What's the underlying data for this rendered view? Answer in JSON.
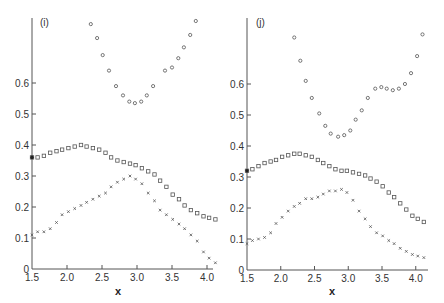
{
  "chart_data": [
    {
      "type": "scatter",
      "panel_label": "(i)",
      "title": "",
      "xlabel": "x",
      "ylabel": "",
      "xlim": [
        1.5,
        4.15
      ],
      "ylim": [
        0,
        0.82
      ],
      "x_ticks": [
        "1.5",
        "2.0",
        "2.5",
        "3.0",
        "3.5",
        "4.0"
      ],
      "y_ticks": [
        "0",
        "0.1",
        "0.2",
        "0.3",
        "0.4",
        "0.5",
        "0.6"
      ],
      "grid": false,
      "legend": null,
      "series": [
        {
          "name": "upper (circles)",
          "marker": "circle",
          "x": [
            2.34,
            2.43,
            2.51,
            2.6,
            2.7,
            2.8,
            2.89,
            2.97,
            3.06,
            3.14,
            3.23,
            3.4,
            3.5,
            3.59,
            3.67,
            3.76,
            3.84
          ],
          "y": [
            0.79,
            0.745,
            0.69,
            0.64,
            0.59,
            0.56,
            0.54,
            0.535,
            0.54,
            0.56,
            0.59,
            0.64,
            0.65,
            0.68,
            0.715,
            0.755,
            0.8
          ]
        },
        {
          "name": "middle (squares)",
          "marker": "square",
          "x": [
            1.5,
            1.58,
            1.67,
            1.76,
            1.85,
            1.93,
            2.02,
            2.11,
            2.2,
            2.28,
            2.37,
            2.46,
            2.55,
            2.63,
            2.72,
            2.81,
            2.9,
            2.98,
            3.07,
            3.16,
            3.25,
            3.33,
            3.42,
            3.51,
            3.6,
            3.68,
            3.77,
            3.86,
            3.95,
            4.03,
            4.12
          ],
          "y": [
            0.36,
            0.36,
            0.365,
            0.375,
            0.38,
            0.385,
            0.39,
            0.395,
            0.4,
            0.395,
            0.39,
            0.385,
            0.375,
            0.36,
            0.35,
            0.345,
            0.34,
            0.335,
            0.325,
            0.315,
            0.305,
            0.285,
            0.265,
            0.24,
            0.225,
            0.205,
            0.19,
            0.18,
            0.17,
            0.165,
            0.16
          ]
        },
        {
          "name": "lower (crosses)",
          "marker": "cross",
          "x": [
            1.5,
            1.58,
            1.67,
            1.76,
            1.85,
            1.93,
            2.02,
            2.11,
            2.2,
            2.28,
            2.37,
            2.46,
            2.55,
            2.63,
            2.72,
            2.81,
            2.9,
            2.98,
            3.07,
            3.16,
            3.25,
            3.33,
            3.42,
            3.51,
            3.6,
            3.68,
            3.77,
            3.86,
            3.95,
            4.03,
            4.12
          ],
          "y": [
            0.11,
            0.12,
            0.12,
            0.13,
            0.15,
            0.175,
            0.185,
            0.195,
            0.205,
            0.215,
            0.225,
            0.235,
            0.245,
            0.265,
            0.28,
            0.29,
            0.3,
            0.29,
            0.275,
            0.245,
            0.22,
            0.19,
            0.175,
            0.16,
            0.145,
            0.13,
            0.11,
            0.09,
            0.055,
            0.035,
            0.02
          ]
        }
      ]
    },
    {
      "type": "scatter",
      "panel_label": "(j)",
      "title": "",
      "xlabel": "x",
      "ylabel": "",
      "xlim": [
        1.5,
        4.15
      ],
      "ylim": [
        0,
        0.82
      ],
      "x_ticks": [
        "1.5",
        "2.0",
        "2.5",
        "3.0",
        "3.5",
        "4.0"
      ],
      "y_ticks": [
        "0",
        "0.1",
        "0.2",
        "0.3",
        "0.4",
        "0.5",
        "0.6"
      ],
      "grid": false,
      "legend": null,
      "series": [
        {
          "name": "upper (circles)",
          "marker": "circle",
          "x": [
            2.2,
            2.29,
            2.37,
            2.46,
            2.57,
            2.66,
            2.74,
            2.85,
            2.94,
            3.03,
            3.11,
            3.2,
            3.29,
            3.4,
            3.49,
            3.57,
            3.66,
            3.75,
            3.84,
            3.93,
            4.02,
            4.1
          ],
          "y": [
            0.75,
            0.675,
            0.61,
            0.555,
            0.505,
            0.465,
            0.44,
            0.43,
            0.435,
            0.45,
            0.485,
            0.515,
            0.555,
            0.585,
            0.59,
            0.585,
            0.58,
            0.585,
            0.6,
            0.635,
            0.69,
            0.76
          ]
        },
        {
          "name": "middle (squares)",
          "marker": "square",
          "x": [
            1.5,
            1.58,
            1.67,
            1.76,
            1.85,
            1.93,
            2.02,
            2.11,
            2.2,
            2.28,
            2.37,
            2.46,
            2.55,
            2.63,
            2.72,
            2.81,
            2.9,
            2.98,
            3.07,
            3.16,
            3.25,
            3.33,
            3.42,
            3.51,
            3.6,
            3.68,
            3.77,
            3.86,
            3.95,
            4.03,
            4.12
          ],
          "y": [
            0.32,
            0.325,
            0.335,
            0.345,
            0.35,
            0.355,
            0.365,
            0.37,
            0.375,
            0.375,
            0.37,
            0.365,
            0.355,
            0.345,
            0.335,
            0.325,
            0.32,
            0.32,
            0.315,
            0.31,
            0.305,
            0.295,
            0.285,
            0.27,
            0.25,
            0.235,
            0.215,
            0.195,
            0.175,
            0.165,
            0.155
          ]
        },
        {
          "name": "lower (crosses)",
          "marker": "cross",
          "x": [
            1.5,
            1.58,
            1.67,
            1.76,
            1.85,
            1.93,
            2.02,
            2.11,
            2.2,
            2.28,
            2.37,
            2.46,
            2.55,
            2.63,
            2.72,
            2.81,
            2.9,
            2.98,
            3.07,
            3.16,
            3.25,
            3.33,
            3.42,
            3.51,
            3.6,
            3.68,
            3.77,
            3.86,
            3.95,
            4.03,
            4.12
          ],
          "y": [
            0.085,
            0.095,
            0.1,
            0.105,
            0.12,
            0.15,
            0.17,
            0.19,
            0.205,
            0.215,
            0.23,
            0.23,
            0.235,
            0.245,
            0.255,
            0.255,
            0.26,
            0.25,
            0.225,
            0.19,
            0.165,
            0.14,
            0.12,
            0.11,
            0.095,
            0.085,
            0.07,
            0.06,
            0.05,
            0.045,
            0.04
          ]
        }
      ]
    }
  ]
}
